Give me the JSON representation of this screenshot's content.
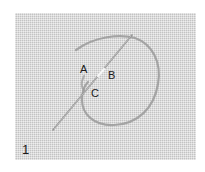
{
  "diagram": {
    "step_number": "1",
    "points": [
      {
        "label": "A",
        "x": 80,
        "y": 64
      },
      {
        "label": "B",
        "x": 108,
        "y": 70
      },
      {
        "label": "C",
        "x": 91,
        "y": 88
      }
    ],
    "colors": {
      "fabric": "#d6d6d6",
      "thread": "#9a9a9a",
      "needle": "#8c8c8c",
      "text": "#1a1a1a"
    }
  }
}
